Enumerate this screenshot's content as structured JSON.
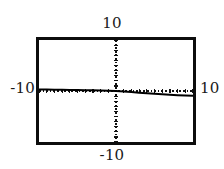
{
  "window": {
    "title": "Graphing calculator viewing window"
  },
  "labels": {
    "y_max": "10",
    "y_min": "-10",
    "x_min": "-10",
    "x_max": "10"
  },
  "colors": {
    "ink": "#0d0d0d",
    "background": "#ffffff",
    "axis": "#111111",
    "curve": "#000000"
  },
  "chart_data": {
    "type": "line",
    "title": "",
    "subtitle": "",
    "xlabel": "",
    "ylabel": "",
    "xlim": [
      -10,
      10
    ],
    "ylim": [
      -10,
      10
    ],
    "xticks": [
      -10,
      -9,
      -8,
      -7,
      -6,
      -5,
      -4,
      -3,
      -2,
      -1,
      0,
      1,
      2,
      3,
      4,
      5,
      6,
      7,
      8,
      9,
      10
    ],
    "yticks": [
      -10,
      -9,
      -8,
      -7,
      -6,
      -5,
      -4,
      -3,
      -2,
      -1,
      0,
      1,
      2,
      3,
      4,
      5,
      6,
      7,
      8,
      9,
      10
    ],
    "tick_style": "dotted-hash-marks",
    "grid": false,
    "legend": false,
    "legend_position": "none",
    "axis_style": {
      "x_axis_visible": true,
      "y_axis_visible": true,
      "drawn_as": "dotted"
    },
    "annotations": [],
    "series": [
      {
        "name": "y",
        "x": [
          -10.0,
          -9.0,
          -8.0,
          -7.0,
          -6.0,
          -5.0,
          -4.0,
          -3.0,
          -2.0,
          -1.0,
          0.0,
          1.0,
          2.0,
          3.0,
          4.0,
          5.0,
          6.0,
          7.0,
          8.0,
          9.0,
          10.0
        ],
        "y": [
          0.3,
          0.28,
          0.26,
          0.24,
          0.22,
          0.2,
          0.17,
          0.14,
          0.1,
          0.05,
          0.0,
          -0.1,
          -0.22,
          -0.34,
          -0.46,
          -0.56,
          -0.66,
          -0.74,
          -0.82,
          -0.88,
          -0.92
        ]
      }
    ]
  }
}
